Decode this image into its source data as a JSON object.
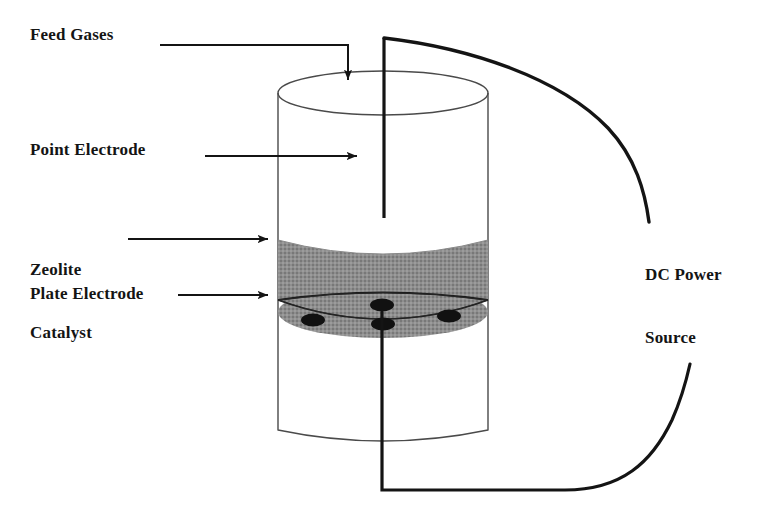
{
  "figure": {
    "background_color": "#ffffff",
    "line_color": "#141414",
    "catalyst_fill_color": "#8a8a8a",
    "vessel_outline_color": "#3a3a3a"
  },
  "labels": {
    "feed_gases": "Feed Gases",
    "point_electrode": "Point Electrode",
    "zeolite_catalyst": "Zeolite\nCatalyst",
    "zeolite_catalyst_line1": "Zeolite",
    "zeolite_catalyst_line2": "Catalyst",
    "plate_electrode": "Plate Electrode",
    "dc_power_source": "DC Power\nSource",
    "dc_power_source_line1": "DC Power",
    "dc_power_source_line2": "Source"
  },
  "components": {
    "vessel": {
      "name": "cylindrical reactor vessel",
      "top_ellipse": {
        "cx": 383,
        "cy": 93,
        "rx": 105,
        "ry": 22
      },
      "bottom_arc_y": 430,
      "left_wall_x": 278,
      "right_wall_x": 488
    },
    "catalyst_bed": {
      "name": "zeolite catalyst bed",
      "top_y": 240,
      "bottom_y": 300,
      "fill": "#8a8a8a"
    },
    "plate_electrode": {
      "name": "perforated plate electrode",
      "ellipse": {
        "cx": 383,
        "cy": 312,
        "rx": 105,
        "ry": 26
      },
      "hole_count": 4,
      "holes": [
        {
          "cx": 313,
          "cy": 320,
          "rx": 12,
          "ry": 6
        },
        {
          "cx": 382,
          "cy": 305,
          "rx": 12,
          "ry": 6
        },
        {
          "cx": 383,
          "cy": 324,
          "rx": 12,
          "ry": 6
        },
        {
          "cx": 449,
          "cy": 316,
          "rx": 12,
          "ry": 6
        }
      ]
    },
    "point_electrode": {
      "name": "point electrode rod",
      "x": 384,
      "top_y": 38,
      "bottom_y": 218
    },
    "upper_wire": {
      "name": "upper electrode lead to DC power source",
      "start": [
        384,
        38
      ],
      "end": [
        650,
        222
      ]
    },
    "lower_wire": {
      "name": "lower plate electrode lead to DC power source",
      "start": [
        382,
        312
      ],
      "corner": [
        382,
        490
      ],
      "end": [
        690,
        300
      ]
    }
  },
  "annotations": [
    {
      "name": "feed-gases-arrow",
      "label": "Feed Gases",
      "path": "horizontal then down into vessel top",
      "arrow_tip": [
        348,
        92
      ]
    },
    {
      "name": "point-electrode-arrow",
      "label": "Point Electrode",
      "arrow_tip": [
        368,
        156
      ]
    },
    {
      "name": "zeolite-catalyst-arrow",
      "label": "Zeolite Catalyst",
      "arrow_tip": [
        278,
        239
      ]
    },
    {
      "name": "plate-electrode-arrow",
      "label": "Plate Electrode",
      "arrow_tip": [
        278,
        295
      ]
    }
  ]
}
